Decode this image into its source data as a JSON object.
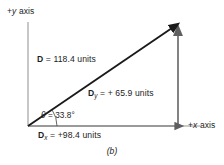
{
  "figure": {
    "caption": "(b)",
    "axes": {
      "y_label_sign": "+",
      "y_label_var": "y",
      "y_label_word": " axis",
      "x_label_sign": "+",
      "x_label_var": "x",
      "x_label_word": " axis"
    },
    "labels": {
      "resultant_symbol": "D",
      "resultant_eq": " =  118.4 units",
      "resultant_full": "D = 118.4 units",
      "component_y_symbol": "D",
      "component_y_sub": "y",
      "component_y_eq": " =  + 65.9 units",
      "component_y_full": "Dy = + 65.9 units",
      "component_x_symbol": "D",
      "component_x_sub": "x",
      "component_x_eq": " =  +98.4 units",
      "component_x_full": "Dx = +98.4 units",
      "angle_symbol": "θ",
      "angle_eq": " =  33.8°",
      "angle_full": "θ = 33.8°"
    },
    "values": {
      "magnitude": 118.4,
      "component_x": 98.4,
      "component_y": 65.9,
      "angle_degrees": 33.8,
      "units": "units"
    },
    "colors": {
      "vector": "#1a1a1a",
      "axis": "#8c8c8c",
      "component": "#7a7a7a",
      "component_arrow": "#5a5a5a",
      "background": "#ffffff",
      "text": "#1d1d1d"
    },
    "geometry": {
      "origin_x": 28,
      "origin_y": 126,
      "tip_x": 176,
      "tip_y": 25,
      "x_axis_end": 200,
      "y_axis_top": 22
    }
  }
}
